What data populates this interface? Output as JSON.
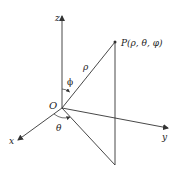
{
  "diagram": {
    "colors": {
      "stroke": "#333333",
      "text": "#222222",
      "background": "#ffffff"
    },
    "labels": {
      "z_axis": "z",
      "y_axis": "y",
      "x_axis": "x",
      "origin": "O",
      "point": "P(ρ, θ, φ)",
      "rho": "ρ",
      "phi": "ϕ",
      "theta": "θ"
    }
  }
}
